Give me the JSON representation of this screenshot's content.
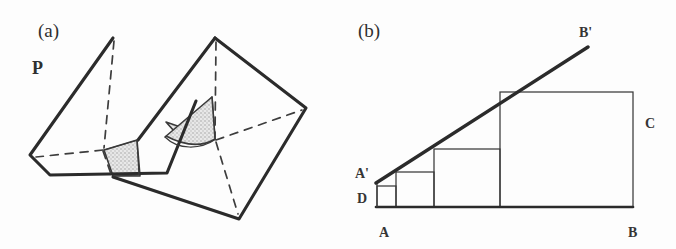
{
  "figure": {
    "background_color": "#fdfdfd",
    "ink_color": "#2b2b2b",
    "stipple_fill_color": "#cfcfcf",
    "panels": [
      {
        "id": "a",
        "label": "(a)",
        "label_x": 38,
        "label_y": 37,
        "description": "Two intersecting quadrilateral planes in 3D, intersection curve shaded",
        "plane_label": {
          "text": "P",
          "x": 32,
          "y": 74
        },
        "left_plane": {
          "name": "plane-P-left",
          "outline": "113,38 30,155 50,174 167,173 195,101",
          "hidden_edges": [
            "113,38 103,149",
            "103,149 36,157",
            "103,149 112,178"
          ]
        },
        "right_plane": {
          "name": "plane-right",
          "outline": "215,38 305,108 238,218 113,176 165,136",
          "hidden_edges": [
            "215,38 215,140",
            "215,140 301,110",
            "215,140 238,214",
            "215,140 165,137"
          ]
        },
        "shaded_regions": [
          {
            "name": "shaded-region-large",
            "polygon": "166,122 215,139 212,97 182,140"
          },
          {
            "name": "shaded-region-small",
            "polygon": "104,151 138,141 139,175 113,176"
          }
        ]
      },
      {
        "id": "b",
        "label": "(b)",
        "label_x": 358,
        "label_y": 37,
        "description": "Staircase of nested rectangles inscribed under a diagonal line A'B'",
        "vertex_labels": [
          {
            "name": "label-A-prime",
            "text": "A'",
            "x": 355,
            "y": 178
          },
          {
            "name": "label-B-prime",
            "text": "B'",
            "x": 579,
            "y": 37
          },
          {
            "name": "label-D",
            "text": "D",
            "x": 357,
            "y": 203
          },
          {
            "name": "label-A",
            "text": "A",
            "x": 379,
            "y": 237
          },
          {
            "name": "label-B",
            "text": "B",
            "x": 628,
            "y": 237
          },
          {
            "name": "label-C",
            "text": "C",
            "x": 645,
            "y": 128
          }
        ],
        "baseline": {
          "name": "baseline-AB",
          "x1": 376,
          "y1": 207,
          "x2": 633,
          "y2": 207
        },
        "diagonal": {
          "name": "diagonal-A-prime-B-prime",
          "x1": 376,
          "y1": 183,
          "x2": 588,
          "y2": 47
        },
        "rectangles": [
          {
            "name": "step-rect-1",
            "x": 377,
            "y": 186,
            "w": 19,
            "h": 21
          },
          {
            "name": "step-rect-2",
            "x": 396,
            "y": 172,
            "w": 38,
            "h": 35
          },
          {
            "name": "step-rect-3",
            "x": 434,
            "y": 149,
            "w": 66,
            "h": 58
          },
          {
            "name": "step-rect-4",
            "x": 500,
            "y": 92,
            "w": 133,
            "h": 115
          }
        ]
      }
    ]
  }
}
